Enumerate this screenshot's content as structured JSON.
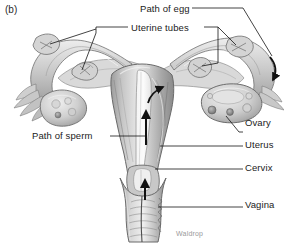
{
  "figure": {
    "panel_label": "(b)",
    "credit": "Waldrop",
    "style": "grayscale-line-and-tone-illustration",
    "background_color": "#ffffff",
    "ink_color": "#1b1b1b",
    "tissue_colors": {
      "light": "#e2e2e2",
      "mid": "#b9b9b9",
      "dark": "#8d8d8d",
      "shadow": "#6f6f6f",
      "highlight": "#f2f2f2"
    }
  },
  "labels": {
    "path_of_egg": "Path of egg",
    "uterine_tubes": "Uterine tubes",
    "path_of_sperm": "Path of sperm",
    "ovary": "Ovary",
    "uterus": "Uterus",
    "cervix": "Cervix",
    "vagina": "Vagina"
  },
  "label_list": [
    {
      "id": "path-of-egg",
      "text": "Path of egg",
      "side": "top",
      "x": 140,
      "y": 4
    },
    {
      "id": "uterine-tubes",
      "text": "Uterine tubes",
      "side": "top",
      "x": 131,
      "y": 23
    },
    {
      "id": "path-of-sperm",
      "text": "Path of sperm",
      "side": "left",
      "x": 32,
      "y": 131
    },
    {
      "id": "ovary",
      "text": "Ovary",
      "side": "right",
      "x": 245,
      "y": 118
    },
    {
      "id": "uterus",
      "text": "Uterus",
      "side": "right",
      "x": 245,
      "y": 140
    },
    {
      "id": "cervix",
      "text": "Cervix",
      "side": "right",
      "x": 245,
      "y": 163
    },
    {
      "id": "vagina",
      "text": "Vagina",
      "side": "right",
      "x": 245,
      "y": 200
    }
  ],
  "annotations": {
    "flow_arrows": [
      {
        "id": "sperm-vagina-arrow",
        "direction": "up",
        "description": "black arrow in vagina pointing toward cervix"
      },
      {
        "id": "sperm-uterus-arrow",
        "direction": "up",
        "description": "black arrow in uterine cavity pointing toward fundus"
      },
      {
        "id": "sperm-tube-arrow",
        "direction": "up",
        "description": "curved black arrow entering right uterine tube"
      },
      {
        "id": "egg-tube-arrow",
        "direction": "down",
        "description": "curved black arrow on right tube showing egg travelling toward uterus"
      }
    ]
  }
}
